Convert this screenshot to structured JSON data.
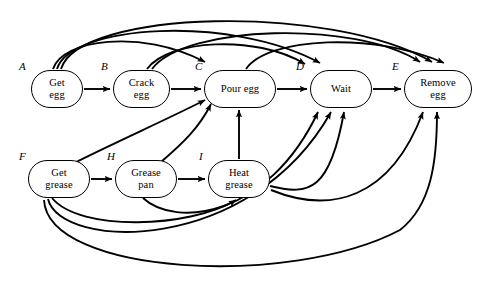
{
  "figure": {
    "background": "#ffffff",
    "stroke": "#000000",
    "width": 501,
    "height": 287
  },
  "nodes": [
    {
      "id": "A",
      "state_label": "A",
      "line1": "Get",
      "line2": "egg",
      "x": 31,
      "y": 70,
      "w": 52,
      "h": 38
    },
    {
      "id": "B",
      "state_label": "B",
      "line1": "Crack",
      "line2": "egg",
      "x": 113,
      "y": 70,
      "w": 57,
      "h": 38
    },
    {
      "id": "C",
      "state_label": "C",
      "line1": "Pour egg",
      "line2": "",
      "x": 204,
      "y": 70,
      "w": 72,
      "h": 38
    },
    {
      "id": "D",
      "state_label": "D",
      "line1": "Wait",
      "line2": "",
      "x": 310,
      "y": 70,
      "w": 62,
      "h": 38
    },
    {
      "id": "E",
      "state_label": "E",
      "line1": "Remove",
      "line2": "egg",
      "x": 404,
      "y": 70,
      "w": 68,
      "h": 38
    },
    {
      "id": "F",
      "state_label": "F",
      "line1": "Get",
      "line2": "grease",
      "x": 28,
      "y": 160,
      "w": 62,
      "h": 38
    },
    {
      "id": "H",
      "state_label": "H",
      "line1": "Grease",
      "line2": "pan",
      "x": 115,
      "y": 160,
      "w": 62,
      "h": 38
    },
    {
      "id": "I",
      "state_label": "I",
      "line1": "Heat",
      "line2": "grease",
      "x": 208,
      "y": 160,
      "w": 62,
      "h": 38
    }
  ],
  "state_labels": [
    {
      "text": "A",
      "x": 19,
      "y": 60
    },
    {
      "text": "B",
      "x": 101,
      "y": 60
    },
    {
      "text": "C",
      "x": 195,
      "y": 60
    },
    {
      "text": "D",
      "x": 296,
      "y": 60
    },
    {
      "text": "E",
      "x": 392,
      "y": 60
    },
    {
      "text": "F",
      "x": 19,
      "y": 150
    },
    {
      "text": "H",
      "x": 107,
      "y": 150
    },
    {
      "text": "I",
      "x": 199,
      "y": 150
    }
  ],
  "edges": [
    {
      "name": "edge-A-to-B",
      "from": "A",
      "to": "B",
      "kind": "straight"
    },
    {
      "name": "edge-B-to-C",
      "from": "B",
      "to": "C",
      "kind": "straight"
    },
    {
      "name": "edge-C-to-D",
      "from": "C",
      "to": "D",
      "kind": "straight"
    },
    {
      "name": "edge-D-to-E",
      "from": "D",
      "to": "E",
      "kind": "straight"
    },
    {
      "name": "edge-F-to-H",
      "from": "F",
      "to": "H",
      "kind": "straight"
    },
    {
      "name": "edge-H-to-I",
      "from": "H",
      "to": "I",
      "kind": "straight"
    },
    {
      "name": "edge-I-to-C",
      "from": "I",
      "to": "C",
      "kind": "straight"
    },
    {
      "name": "edge-A-to-C",
      "from": "A",
      "to": "C",
      "kind": "arc-top"
    },
    {
      "name": "edge-A-to-D",
      "from": "A",
      "to": "D",
      "kind": "arc-top"
    },
    {
      "name": "edge-A-to-E",
      "from": "A",
      "to": "E",
      "kind": "arc-top"
    },
    {
      "name": "edge-B-to-D",
      "from": "B",
      "to": "D",
      "kind": "arc-top"
    },
    {
      "name": "edge-B-to-E",
      "from": "B",
      "to": "E",
      "kind": "arc-top"
    },
    {
      "name": "edge-C-to-E",
      "from": "C",
      "to": "E",
      "kind": "arc-top"
    },
    {
      "name": "edge-F-to-C",
      "from": "F",
      "to": "C",
      "kind": "diagonal"
    },
    {
      "name": "edge-H-to-C",
      "from": "H",
      "to": "C",
      "kind": "diagonal"
    },
    {
      "name": "edge-F-to-I",
      "from": "F",
      "to": "I",
      "kind": "arc-bottom"
    },
    {
      "name": "edge-F-to-D",
      "from": "F",
      "to": "D",
      "kind": "arc-bottom"
    },
    {
      "name": "edge-F-to-E",
      "from": "F",
      "to": "E",
      "kind": "arc-bottom"
    },
    {
      "name": "edge-H-to-D",
      "from": "H",
      "to": "D",
      "kind": "arc-bottom"
    },
    {
      "name": "edge-I-to-D",
      "from": "I",
      "to": "D",
      "kind": "arc-bottom"
    },
    {
      "name": "edge-I-to-E",
      "from": "I",
      "to": "E",
      "kind": "arc-bottom"
    }
  ]
}
